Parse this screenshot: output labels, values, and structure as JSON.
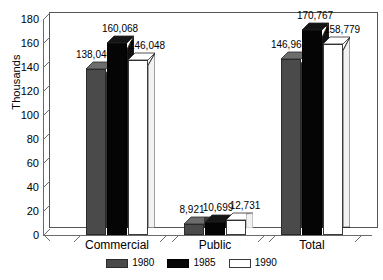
{
  "chart_data": {
    "type": "bar",
    "title": "",
    "subtitle": "",
    "xlabel": "",
    "ylabel": "Thousands",
    "ylim": [
      0,
      180
    ],
    "ytick_step": 20,
    "yticks": [
      180,
      160,
      140,
      120,
      100,
      80,
      60,
      40,
      20,
      0
    ],
    "ytick_labels": [
      "180",
      "160",
      "140",
      "120",
      "100",
      "80",
      "60",
      "40",
      "20",
      "0"
    ],
    "grid": false,
    "legend_position": "bottom-center",
    "units_note": "values shown in data labels are in raw units; axis is in thousands",
    "categories": [
      "Commercial",
      "Public",
      "Total"
    ],
    "series": [
      {
        "name": "1980",
        "color": "#4a4a4a",
        "values": [
          138.04,
          8.921,
          146.961
        ],
        "labels": [
          "138,040",
          "8,921",
          "146,961"
        ]
      },
      {
        "name": "1985",
        "color": "#050505",
        "values": [
          160.068,
          10.699,
          170.767
        ],
        "labels": [
          "160,068",
          "10,699",
          "170,767"
        ]
      },
      {
        "name": "1990",
        "color": "#ffffff",
        "values": [
          146.048,
          12.731,
          158.779
        ],
        "labels": [
          "146,048",
          "12,731",
          "158,779"
        ]
      }
    ]
  },
  "legend": {
    "items": [
      {
        "label": "1980",
        "swatch": "gray-swatch"
      },
      {
        "label": "1985",
        "swatch": "black-swatch"
      },
      {
        "label": "1990",
        "swatch": "white-swatch"
      }
    ]
  },
  "axis": {
    "y_title": "Thousands"
  }
}
